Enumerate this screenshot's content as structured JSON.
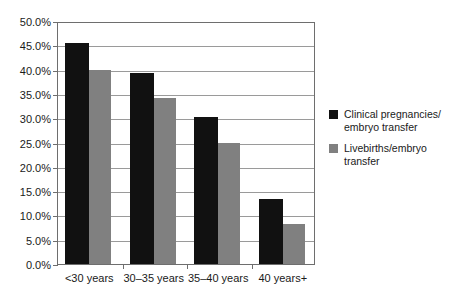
{
  "chart_data": {
    "type": "bar",
    "title": "",
    "subtitle": "",
    "xlabel": "",
    "ylabel": "",
    "ylim": [
      0,
      50
    ],
    "ytick_step": 5,
    "ytick_labels": [
      "0.0%",
      "5.0%",
      "10.0%",
      "15.0%",
      "20.0%",
      "25.0%",
      "30.0%",
      "35.0%",
      "40.0%",
      "45.0%",
      "50.0%"
    ],
    "ytick_values": [
      0,
      5,
      10,
      15,
      20,
      25,
      30,
      35,
      40,
      45,
      50
    ],
    "grid": "horizontal",
    "legend_position": "right",
    "categories": [
      "<30 years",
      "30–35 years",
      "35–40 years",
      "40 years+"
    ],
    "series": [
      {
        "name": "Clinical pregnancies/\nembryo transfer",
        "color": "#111111",
        "values": [
          45.5,
          39.3,
          30.3,
          13.4
        ]
      },
      {
        "name": "Livebirths/embryo\ntransfer",
        "color": "#808080",
        "values": [
          40.0,
          34.1,
          24.9,
          8.2
        ]
      }
    ]
  },
  "axes": {
    "axis_color": "#6e6e6e",
    "gridline_color": "#9a9a9a"
  }
}
